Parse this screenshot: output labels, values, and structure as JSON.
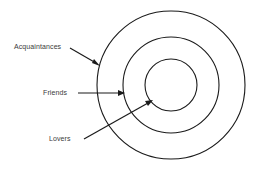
{
  "diagram": {
    "type": "concentric-circles",
    "background_color": "#ffffff",
    "stroke_color": "#1a1a1a",
    "label_color": "#3a3a3a",
    "center": {
      "x": 171,
      "y": 85
    },
    "rings": [
      {
        "name": "acquaintances-ring",
        "radius": 74,
        "label": "Acquaintances"
      },
      {
        "name": "friends-ring",
        "radius": 48,
        "label": "Friends"
      },
      {
        "name": "lovers-ring",
        "radius": 26,
        "label": "Lovers"
      }
    ],
    "labels": {
      "acquaintances": "Acquaintances",
      "friends": "Friends",
      "lovers": "Lovers"
    },
    "arrows": [
      {
        "name": "acquaintances-arrow",
        "from": {
          "x": 70,
          "y": 48
        },
        "to": {
          "x": 99,
          "y": 66
        }
      },
      {
        "name": "friends-arrow",
        "from": {
          "x": 78,
          "y": 93
        },
        "to": {
          "x": 124,
          "y": 93
        }
      },
      {
        "name": "lovers-arrow",
        "from": {
          "x": 84,
          "y": 139
        },
        "to": {
          "x": 152,
          "y": 100
        }
      }
    ]
  }
}
